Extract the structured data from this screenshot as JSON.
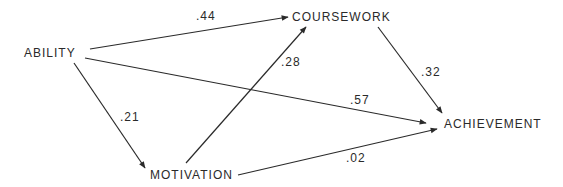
{
  "diagram": {
    "type": "path-diagram",
    "nodes": {
      "ability": {
        "label": "ABILITY"
      },
      "coursework": {
        "label": "COURSEWORK"
      },
      "motivation": {
        "label": "MOTIVATION"
      },
      "achievement": {
        "label": "ACHIEVEMENT"
      }
    },
    "edges": [
      {
        "from": "ABILITY",
        "to": "COURSEWORK",
        "coefficient": ".44"
      },
      {
        "from": "ABILITY",
        "to": "ACHIEVEMENT",
        "coefficient": ".57"
      },
      {
        "from": "ABILITY",
        "to": "MOTIVATION",
        "coefficient": ".21"
      },
      {
        "from": "MOTIVATION",
        "to": "COURSEWORK",
        "coefficient": ".28"
      },
      {
        "from": "COURSEWORK",
        "to": "ACHIEVEMENT",
        "coefficient": ".32"
      },
      {
        "from": "MOTIVATION",
        "to": "ACHIEVEMENT",
        "coefficient": ".02"
      }
    ],
    "colors": {
      "line": "#2a2a2a",
      "text": "#2a2a2a",
      "background": "#ffffff"
    }
  }
}
